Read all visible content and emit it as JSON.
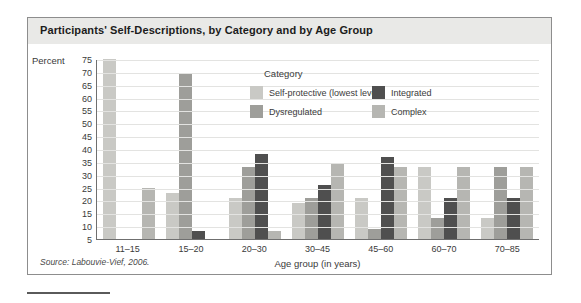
{
  "figure": {
    "title": "Participants' Self-Descriptions, by Category and by Age Group",
    "source": "Source: Labouvie-Vief, 2006."
  },
  "legend": {
    "title": "Category",
    "items": [
      {
        "label": "Self-protective (lowest level)",
        "color": "#c9c9c5"
      },
      {
        "label": "Integrated",
        "color": "#4f4f4f"
      },
      {
        "label": "Dysregulated",
        "color": "#9e9e9a"
      },
      {
        "label": "Complex",
        "color": "#b6b6b2"
      }
    ]
  },
  "chart_data": {
    "type": "bar",
    "title": "Participants' Self-Descriptions, by Category and by Age Group",
    "xlabel": "Age group (in years)",
    "ylabel": "Percent",
    "ylim": [
      5,
      75
    ],
    "yticks": [
      75,
      70,
      65,
      60,
      55,
      50,
      45,
      40,
      35,
      30,
      25,
      20,
      15,
      10,
      5
    ],
    "grid": true,
    "legend_position": "inside-top-center",
    "categories": [
      "11–15",
      "15–20",
      "20–30",
      "30–45",
      "45–60",
      "60–70",
      "70–85"
    ],
    "series": [
      {
        "name": "Self-protective (lowest level)",
        "color": "#c9c9c5",
        "values": [
          75,
          23,
          21,
          19,
          21,
          33,
          13
        ]
      },
      {
        "name": "Dysregulated",
        "color": "#9e9e9a",
        "values": [
          null,
          69,
          33,
          21,
          9,
          13,
          33
        ]
      },
      {
        "name": "Integrated",
        "color": "#4f4f4f",
        "values": [
          null,
          8,
          38,
          26,
          37,
          21,
          21
        ]
      },
      {
        "name": "Complex",
        "color": "#b6b6b2",
        "values": [
          25,
          null,
          8,
          34,
          33,
          33,
          33
        ]
      }
    ]
  }
}
